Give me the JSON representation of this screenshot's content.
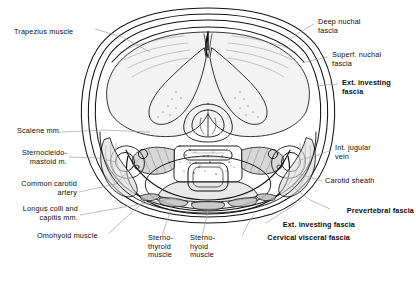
{
  "figure": {
    "kind": "anatomical-cross-section",
    "region": "neck",
    "view": "axial / transverse section",
    "background_color": "#ffffff",
    "line_color": "#111111",
    "leader_line_color": "#9a9a9a"
  },
  "labels": {
    "left": [
      {
        "id": "trapezius-muscle",
        "text": "Trapezius muscle",
        "bold": false,
        "align": "left",
        "x": 14,
        "y": 28
      },
      {
        "id": "scalene-mm",
        "text": "Scalene mm.",
        "bold": false,
        "align": "left",
        "x": 17,
        "y": 131
      },
      {
        "id": "sternocleidomastoid-m",
        "text": "Sternocleido-\nmastoid m.",
        "bold": false,
        "align": "right",
        "x": 18,
        "y": 153
      },
      {
        "id": "common-carotid-artery",
        "text": "Common carotid\nartery",
        "bold": false,
        "align": "right",
        "x": 10,
        "y": 184
      },
      {
        "id": "longus-colli-capitis-mm",
        "text": "Longus colli and\ncapitis mm.",
        "bold": false,
        "align": "right",
        "x": 14,
        "y": 209
      },
      {
        "id": "omohyoid-muscle",
        "text": "Omohyoid muscle",
        "bold": false,
        "align": "left",
        "x": 37,
        "y": 236
      }
    ],
    "bottom": [
      {
        "id": "sternothyroid-muscle",
        "text": "Sterno-\nthyroid\nmuscle",
        "bold": false,
        "align": "left",
        "x": 148,
        "y": 238
      },
      {
        "id": "sternohyoid-muscle",
        "text": "Sterno-\nhyoid\nmuscle",
        "bold": false,
        "align": "left",
        "x": 190,
        "y": 238
      }
    ],
    "right": [
      {
        "id": "deep-nuchal-fascia",
        "text": "Deep nuchal\nfascia",
        "bold": false,
        "align": "left",
        "x": 318,
        "y": 18
      },
      {
        "id": "superf-nuchal-fascia",
        "text": "Superf. nuchal\nfascia",
        "bold": false,
        "align": "left",
        "x": 332,
        "y": 51
      },
      {
        "id": "ext-investing-fascia",
        "text": "Ext. investing\nfascia",
        "bold": true,
        "align": "left",
        "x": 342,
        "y": 79
      },
      {
        "id": "int-jugular-vein",
        "text": "Int. jugular\nvein",
        "bold": false,
        "align": "left",
        "x": 335,
        "y": 145
      },
      {
        "id": "carotid-sheath",
        "text": "Carotid sheath",
        "bold": false,
        "align": "left",
        "x": 325,
        "y": 180
      }
    ],
    "bottom_right": [
      {
        "id": "prevertebral-fascia",
        "text": "Prevertebral fascia",
        "bold": true,
        "align": "right",
        "x": 408,
        "y": 211
      },
      {
        "id": "ext-investing-fascia-2",
        "text": "Ext. investing fascia",
        "bold": true,
        "align": "right",
        "x": 353,
        "y": 225
      },
      {
        "id": "cervical-visceral-fascia",
        "text": "Cervical visceral fascia",
        "bold": true,
        "align": "right",
        "x": 348,
        "y": 238
      }
    ]
  },
  "structures": {
    "spinal_cord": "spinal cord",
    "vertebral_body": "cervical vertebral body",
    "trachea": "trachea",
    "esophagus": "esophagus",
    "thyroid_gland": "thyroid gland"
  }
}
